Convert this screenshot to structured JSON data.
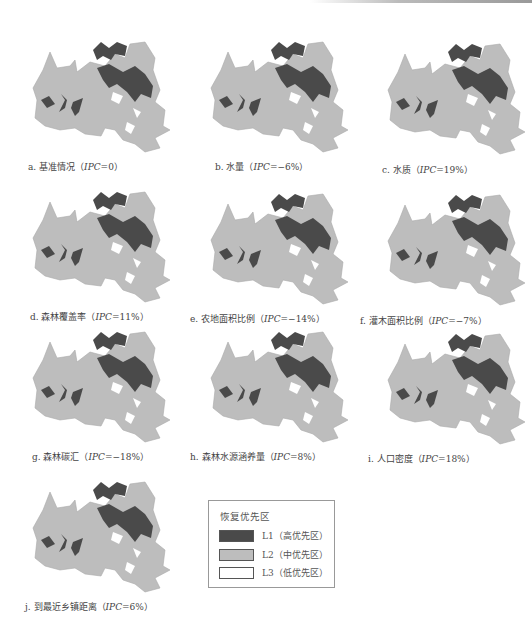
{
  "panels": [
    {
      "id": "a",
      "label": "a. 基准情况（",
      "ipc": "IPC",
      "value": "=0）",
      "x": 5,
      "y": 30,
      "cap_x": 28,
      "cap_y": 166
    },
    {
      "id": "b",
      "label": "b. 水量（",
      "ipc": "IPC",
      "value": "=−6%）",
      "x": 183,
      "y": 30,
      "cap_x": 215,
      "cap_y": 166
    },
    {
      "id": "c",
      "label": "c. 水质（",
      "ipc": "IPC",
      "value": "=19%）",
      "x": 360,
      "y": 32,
      "cap_x": 382,
      "cap_y": 169
    },
    {
      "id": "d",
      "label": "d. 森林覆盖率（",
      "ipc": "IPC",
      "value": "=11%）",
      "x": 5,
      "y": 180,
      "cap_x": 30,
      "cap_y": 316
    },
    {
      "id": "e",
      "label": "e. 农地面积比例（",
      "ipc": "IPC",
      "value": "=−14%）",
      "x": 183,
      "y": 182,
      "cap_x": 190,
      "cap_y": 318
    },
    {
      "id": "f",
      "label": "f. 灌木面积比例（",
      "ipc": "IPC",
      "value": "=−7%）",
      "x": 360,
      "y": 183,
      "cap_x": 360,
      "cap_y": 320
    },
    {
      "id": "g",
      "label": "g. 森林碳汇（",
      "ipc": "IPC",
      "value": "=−18%）",
      "x": 5,
      "y": 320,
      "cap_x": 32,
      "cap_y": 456
    },
    {
      "id": "h",
      "label": "h. 森林水源涵养量（",
      "ipc": "IPC",
      "value": "=8%）",
      "x": 183,
      "y": 320,
      "cap_x": 190,
      "cap_y": 456
    },
    {
      "id": "i",
      "label": "i. 人口密度（",
      "ipc": "IPC",
      "value": "=18%）",
      "x": 360,
      "y": 322,
      "cap_x": 368,
      "cap_y": 458
    },
    {
      "id": "j",
      "label": "j. 到最近乡镇距离（",
      "ipc": "IPC",
      "value": "=6%）",
      "x": 5,
      "y": 470,
      "cap_x": 25,
      "cap_y": 606
    }
  ],
  "legend": {
    "title": "恢复优先区",
    "items": [
      {
        "label": "L1（高优先区）",
        "color": "#4a4a4a"
      },
      {
        "label": "L2（中优先区）",
        "color": "#bdbdbd"
      },
      {
        "label": "L3（低优先区）",
        "color": "#ffffff"
      }
    ]
  },
  "colors": {
    "high": "#4a4a4a",
    "mid": "#bdbdbd",
    "low": "#ffffff"
  }
}
